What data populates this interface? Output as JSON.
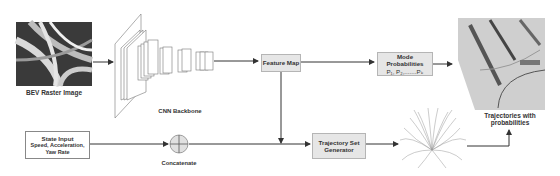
{
  "diagram": {
    "inputs": {
      "bev_raster": {
        "label": "BEV Raster Image"
      },
      "state_input": {
        "title": "State Input",
        "detail": "Speed, Acceleration, Yaw Rate"
      }
    },
    "cnn": {
      "label": "CNN Backbone"
    },
    "feature_map": {
      "label": "Feature Map"
    },
    "mode_probabilities": {
      "title": "Mode Probabilities",
      "formula": "P₁, P₂,.......Pₖ"
    },
    "concatenate": {
      "label": "Concatenate"
    },
    "trajectory_set_generator": {
      "label": "Trajectory Set Generator"
    },
    "output": {
      "label": "Trajectories with probabilities"
    },
    "colors": {
      "box_fill": "#e6e6e6",
      "box_border": "#b5b5b5",
      "arrow": "#333333"
    }
  }
}
